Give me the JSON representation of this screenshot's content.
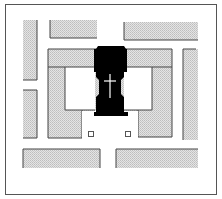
{
  "diagram": {
    "type": "site-plan",
    "colors": {
      "background": "#ffffff",
      "frame": "#555555",
      "building_fill": "#d6d6d6",
      "building_edge": "#444444",
      "church_fill": "#000000",
      "cross": "#ffffff",
      "marker": "#ffffff"
    },
    "frame": {
      "x": 5,
      "y": 4,
      "w": 212,
      "h": 191
    },
    "buildings": [
      {
        "name": "left-bar-upper",
        "x": 23,
        "y": 20,
        "w": 14,
        "h": 60
      },
      {
        "name": "left-bar-lower",
        "x": 23,
        "y": 90,
        "w": 14,
        "h": 48
      },
      {
        "name": "top-bar-left",
        "x": 50,
        "y": 20,
        "w": 47,
        "h": 18
      },
      {
        "name": "top-bar-right",
        "x": 124,
        "y": 22,
        "w": 74,
        "h": 18
      },
      {
        "name": "right-bar",
        "x": 183,
        "y": 49,
        "w": 15,
        "h": 91
      },
      {
        "name": "bottom-bar-left",
        "x": 23,
        "y": 149,
        "w": 77,
        "h": 19
      },
      {
        "name": "bottom-bar-right",
        "x": 116,
        "y": 149,
        "w": 82,
        "h": 19
      }
    ],
    "church": {
      "cross": true
    },
    "markers": [
      {
        "name": "square-marker-left",
        "x": 88,
        "y": 131,
        "size": 5
      },
      {
        "name": "square-marker-right",
        "x": 125,
        "y": 131,
        "size": 5
      }
    ]
  }
}
